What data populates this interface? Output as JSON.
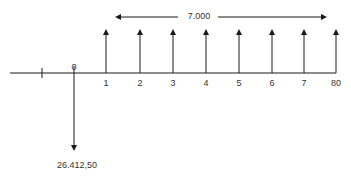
{
  "diagram": {
    "type": "cash-flow-timeline",
    "period_labels": [
      "0",
      "1",
      "2",
      "3",
      "4",
      "5",
      "6",
      "7",
      "80"
    ],
    "inflow_amount": "7.000",
    "outflow_amount": "26.412,50",
    "colors": {
      "line": "#1a1a1a",
      "text": "#333333"
    }
  }
}
